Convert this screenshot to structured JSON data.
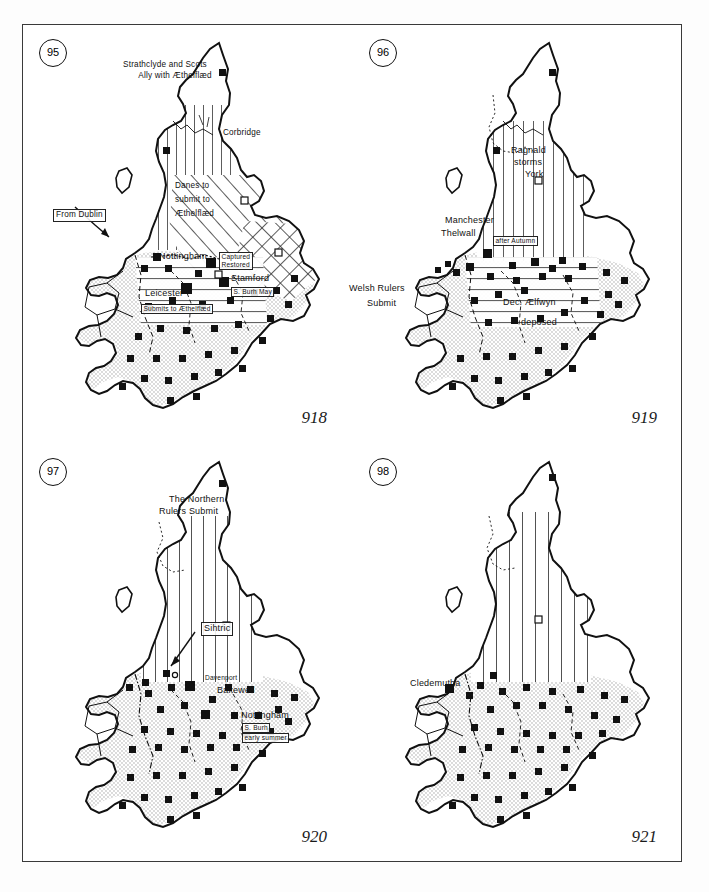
{
  "figure": {
    "panel_count": 4
  },
  "panels": [
    {
      "number": "95",
      "year": "918",
      "labels": [
        {
          "name": "strathclyde-scots",
          "text": "Strathclyde and Scots",
          "boxed": false
        },
        {
          "name": "ally-aethelflaed",
          "text": "Ally with Æthelflæd",
          "boxed": false
        },
        {
          "name": "corbridge",
          "text": "Corbridge",
          "boxed": false
        },
        {
          "name": "danes-submit-1",
          "text": "Danes to",
          "boxed": false
        },
        {
          "name": "danes-submit-2",
          "text": "submit to",
          "boxed": false
        },
        {
          "name": "danes-submit-3",
          "text": "Æthelflæd",
          "boxed": false
        },
        {
          "name": "from-dublin",
          "text": "From Dublin",
          "boxed": true
        },
        {
          "name": "nottingham",
          "text": "Nottingham",
          "boxed": false
        },
        {
          "name": "captured-restored",
          "text": "Captured\nRestored",
          "boxed": true
        },
        {
          "name": "stamford",
          "text": "Stamford",
          "boxed": false
        },
        {
          "name": "s-burh-may",
          "text": "S. Burh May",
          "boxed": true
        },
        {
          "name": "leicester",
          "text": "Leicester",
          "boxed": false
        },
        {
          "name": "submits-to-aethelflaed",
          "text": "Submits to Æthelflæd",
          "boxed": true
        }
      ]
    },
    {
      "number": "96",
      "year": "919",
      "labels": [
        {
          "name": "ragnald-storms-york-1",
          "text": "Ragnald",
          "boxed": false
        },
        {
          "name": "ragnald-storms-york-2",
          "text": "storms",
          "boxed": false
        },
        {
          "name": "ragnald-storms-york-3",
          "text": "York",
          "boxed": false
        },
        {
          "name": "manchester",
          "text": "Manchester",
          "boxed": false
        },
        {
          "name": "thelwall",
          "text": "Thelwall",
          "boxed": false
        },
        {
          "name": "after-autumn",
          "text": "after Autumn",
          "boxed": true
        },
        {
          "name": "welsh-rulers-1",
          "text": "Welsh Rulers",
          "boxed": false
        },
        {
          "name": "welsh-rulers-2",
          "text": "Submit",
          "boxed": false
        },
        {
          "name": "dec-aelfwyn",
          "text": "Dec. Ælfwyn",
          "boxed": false
        },
        {
          "name": "deposed",
          "text": "deposed",
          "boxed": false
        }
      ]
    },
    {
      "number": "97",
      "year": "920",
      "labels": [
        {
          "name": "northern-rulers-1",
          "text": "The Northern",
          "boxed": false
        },
        {
          "name": "northern-rulers-2",
          "text": "Rulers Submit",
          "boxed": false
        },
        {
          "name": "sihtric",
          "text": "Sihtric",
          "boxed": true
        },
        {
          "name": "davenport",
          "text": "Davenport",
          "boxed": false
        },
        {
          "name": "bakewell",
          "text": "Bakewell",
          "boxed": false
        },
        {
          "name": "nottingham",
          "text": "Nottingham",
          "boxed": false
        },
        {
          "name": "s-burh",
          "text": "S. Burh",
          "boxed": true
        },
        {
          "name": "early-summer",
          "text": "early summer",
          "boxed": true
        }
      ]
    },
    {
      "number": "98",
      "year": "921",
      "labels": [
        {
          "name": "cledemutha",
          "text": "Cledemutha",
          "boxed": false
        }
      ]
    }
  ],
  "legend_symbols": {
    "filled_square": "burh-or-fortified-site",
    "open_square": "secondary-site",
    "vertical_hatch": "area-of-northern-submission",
    "diagonal_hatch": "danish-area-submitting",
    "cross_hatch": "east-anglia-danelaw",
    "stipple": "english-mercia-and-wessex"
  },
  "colors": {
    "ink": "#111111",
    "border": "#3a3a3a",
    "stipple": "#cfcfcf",
    "paper": "#ffffff"
  }
}
